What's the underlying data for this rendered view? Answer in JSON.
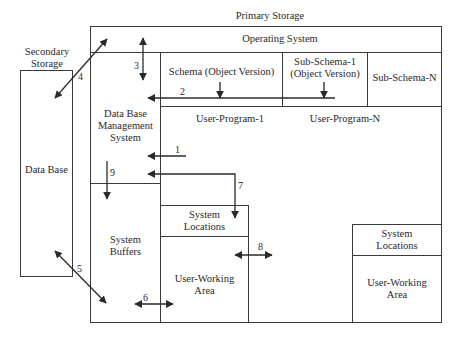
{
  "titles": {
    "primary_storage": "Primary Storage",
    "secondary_storage_line1": "Secondary",
    "secondary_storage_line2": "Storage"
  },
  "boxes": {
    "data_base": "Data Base",
    "operating_system": "Operating System",
    "schema": "Schema (Object Version)",
    "sub_schema_1_line1": "Sub-Schema-1",
    "sub_schema_1_line2": "(Object Version)",
    "sub_schema_n": "Sub-Schema-N",
    "dbms_line1": "Data Base",
    "dbms_line2": "Management",
    "dbms_line3": "System",
    "user_program_1": "User-Program-1",
    "user_program_n": "User-Program-N",
    "system_buffers_line1": "System",
    "system_buffers_line2": "Buffers",
    "system_locations_1_line1": "System",
    "system_locations_1_line2": "Locations",
    "user_working_area_1_line1": "User-Working",
    "user_working_area_1_line2": "Area",
    "system_locations_n_line1": "System",
    "system_locations_n_line2": "Locations",
    "user_working_area_n_line1": "User-Working",
    "user_working_area_n_line2": "Area"
  },
  "arrows": {
    "a1": "1",
    "a2": "2",
    "a3": "3",
    "a4": "4",
    "a5": "5",
    "a6": "6",
    "a7": "7",
    "a8": "8",
    "a9": "9"
  },
  "colors": {
    "line": "#3a3a3a",
    "text": "#2a2a2a",
    "background": "#ffffff"
  }
}
